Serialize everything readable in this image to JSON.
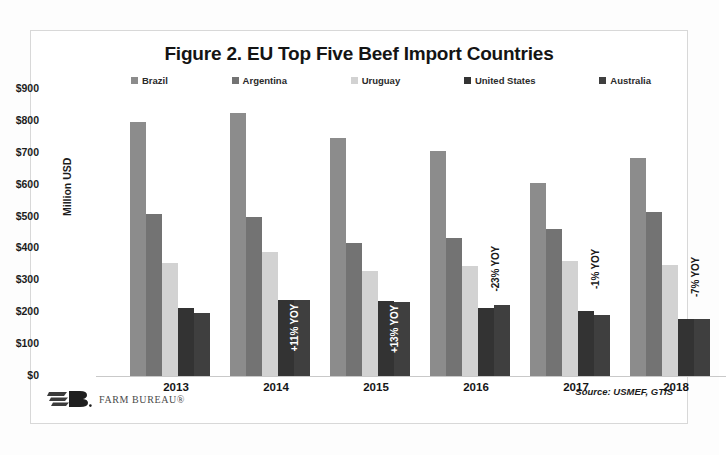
{
  "figure": {
    "title": "Figure 2. EU Top Five Beef Import Countries",
    "source": "Source: USMEF, GTIS",
    "brand": "FARM BUREAU®"
  },
  "chart_data": {
    "type": "bar",
    "title": "Figure 2. EU Top Five Beef Import Countries",
    "xlabel": "",
    "ylabel": "Million USD",
    "ylim": [
      0,
      900
    ],
    "ytick_labels": [
      "$900",
      "$800",
      "$700",
      "$600",
      "$500",
      "$400",
      "$300",
      "$200",
      "$100",
      "$0"
    ],
    "ytick_values": [
      900,
      800,
      700,
      600,
      500,
      400,
      300,
      200,
      100,
      0
    ],
    "categories": [
      "2013",
      "2014",
      "2015",
      "2016",
      "2017",
      "2018"
    ],
    "grid": false,
    "legend_position": "top",
    "series": [
      {
        "name": "Brazil",
        "color": "#8c8c8c",
        "values": [
          795,
          825,
          745,
          705,
          605,
          685
        ]
      },
      {
        "name": "Argentina",
        "color": "#737373",
        "values": [
          508,
          500,
          418,
          432,
          462,
          515
        ]
      },
      {
        "name": "Uruguay",
        "color": "#d2d2d2",
        "values": [
          355,
          388,
          330,
          345,
          362,
          348
        ]
      },
      {
        "name": "United States",
        "color": "#333333",
        "values": [
          212,
          238,
          235,
          212,
          203,
          180
        ]
      },
      {
        "name": "Australia",
        "color": "#3f3f3f",
        "values": [
          198,
          238,
          232,
          222,
          192,
          180
        ]
      }
    ],
    "annotations": [
      {
        "category": "2013",
        "text": "",
        "placement": "none"
      },
      {
        "category": "2014",
        "text": "+11% YOY",
        "placement": "inside"
      },
      {
        "category": "2015",
        "text": "+13% YOY",
        "placement": "inside"
      },
      {
        "category": "2016",
        "text": "-23% YOY",
        "placement": "outside"
      },
      {
        "category": "2017",
        "text": "-1% YOY",
        "placement": "outside"
      },
      {
        "category": "2018",
        "text": "-7% YOY",
        "placement": "outside"
      }
    ]
  }
}
